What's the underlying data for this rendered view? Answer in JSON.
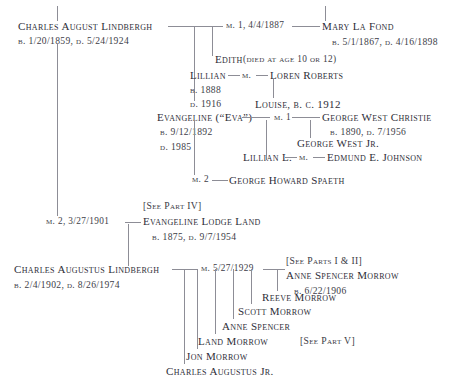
{
  "chart": {
    "type": "genealogy-tree"
  },
  "people": {
    "charles_august": {
      "name": "Charles August Lindbergh",
      "dates": "b. 1/20/1859, d. 5/24/1924"
    },
    "mary_la_fond": {
      "name": "Mary La Fond",
      "dates": "b. 5/1/1867, d. 4/16/1898"
    },
    "edith": {
      "name": "Edith",
      "note": "(died at age 10 or 12)"
    },
    "lillian": {
      "name": "Lillian",
      "born": "b. 1888",
      "died": "d. 1916"
    },
    "loren_roberts": {
      "name": "Loren Roberts"
    },
    "louise": {
      "name": "Louise, b. c. 1912"
    },
    "evangeline_eva": {
      "name": "Evangeline (“Eva”)",
      "born": "b. 9/12/1892",
      "died": "d. 1985"
    },
    "george_west_christie": {
      "name": "George West Christie",
      "dates": "b. 1890, d. 7/1956"
    },
    "george_west_jr": {
      "name": "George West Jr."
    },
    "lillian_l": {
      "name": "Lillian L."
    },
    "edmund_johnson": {
      "name": "Edmund E. Johnson"
    },
    "george_howard_spaeth": {
      "name": "George Howard Spaeth"
    },
    "evangeline_lodge_land": {
      "ref": "[See Part IV]",
      "name": "Evangeline Lodge Land",
      "dates": "b. 1875, d. 9/7/1954"
    },
    "charles_augustus": {
      "name": "Charles Augustus Lindbergh",
      "dates": "b. 2/4/1902, d. 8/26/1974"
    },
    "anne_spencer_morrow": {
      "ref": "[See Parts I & II]",
      "name": "Anne Spencer Morrow",
      "dates": "b. 6/22/1906"
    }
  },
  "marriages": {
    "m1_charles_mary": "m. 1, 4/4/1887",
    "m_lillian_loren": "m.",
    "m1_eva_christie": "m. 1",
    "m_lillian_l_edmund": "m.",
    "m2_eva_spaeth": "m. 2",
    "m2_charles_evangeline": "m. 2, 3/27/1901",
    "m_charles_anne": "m. 5/27/1929"
  },
  "children": {
    "reeve": "Reeve Morrow",
    "scott": "Scott Morrow",
    "anne": "Anne Spencer",
    "land": "Land Morrow",
    "jon": "Jon Morrow",
    "charles_jr": "Charles Augustus Jr."
  },
  "references": {
    "see_part_v": "[See Part V]"
  },
  "colors": {
    "text": "#2e2e38",
    "line": "#8d8d96",
    "background": "#ffffff"
  }
}
